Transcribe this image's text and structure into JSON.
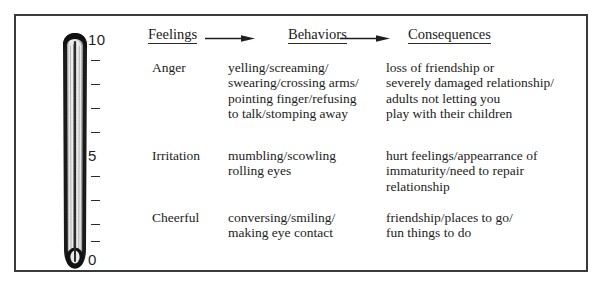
{
  "frame": {
    "border_color": "#3a3a3a"
  },
  "thermometer": {
    "name": "feelings-thermometer",
    "scale": {
      "top_label": "10",
      "middle_label": "5",
      "bottom_label": "0",
      "tick_count_upper": 4,
      "tick_count_lower": 4
    },
    "colors": {
      "outline": "#1a1a1a",
      "interior": "#e8e8e8",
      "capillary": "#2b2b2b"
    }
  },
  "header": {
    "columns": [
      {
        "label": "Feelings",
        "name": "header-feelings"
      },
      {
        "label": "Behaviors",
        "name": "header-behaviors"
      },
      {
        "label": "Consequences",
        "name": "header-consequences"
      }
    ],
    "arrows": [
      {
        "name": "arrow-feelings-to-behaviors"
      },
      {
        "name": "arrow-behaviors-to-consequences"
      }
    ]
  },
  "rows": [
    {
      "id": "anger",
      "feeling": "Anger",
      "behaviors": "yelling/screaming/\nswearing/crossing arms/\npointing finger/refusing\nto talk/stomping away",
      "consequences": "loss of friendship or\nseverely damaged relationship/\nadults not letting you\nplay with their children"
    },
    {
      "id": "irritation",
      "feeling": "Irritation",
      "behaviors": "mumbling/scowling\nrolling eyes",
      "consequences": "hurt feelings/appearrance of\nimmaturity/need to repair\nrelationship"
    },
    {
      "id": "cheerful",
      "feeling": "Cheerful",
      "behaviors": "conversing/smiling/\nmaking eye contact",
      "consequences": "friendship/places to go/\nfun things to do"
    }
  ]
}
